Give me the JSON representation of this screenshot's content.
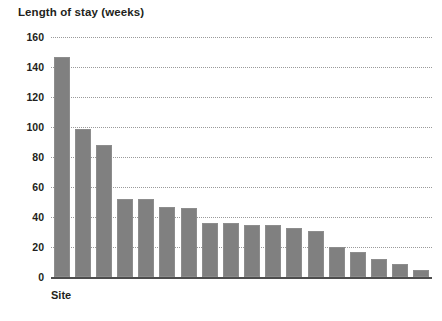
{
  "chart_data": {
    "type": "bar",
    "title": "Length of stay (weeks)",
    "xlabel": "Site",
    "ylabel": "Length of stay (weeks)",
    "ylim": [
      0,
      160
    ],
    "ytick_step": 20,
    "yticks": [
      0,
      20,
      40,
      60,
      80,
      100,
      120,
      140,
      160
    ],
    "grid": true,
    "legend": "none",
    "bar_color": "#808080",
    "categories": [
      "1",
      "2",
      "3",
      "4",
      "5",
      "6",
      "7",
      "8",
      "9",
      "10",
      "11",
      "12",
      "13",
      "14",
      "15",
      "16",
      "17",
      "18"
    ],
    "values": [
      147,
      99,
      88,
      52,
      52,
      47,
      46,
      36,
      36,
      35,
      35,
      33,
      31,
      20,
      17,
      12,
      9,
      5
    ]
  },
  "axis": {
    "ticks": [
      {
        "label": "160",
        "value": 160
      },
      {
        "label": "140",
        "value": 140
      },
      {
        "label": "120",
        "value": 120
      },
      {
        "label": "100",
        "value": 100
      },
      {
        "label": "80",
        "value": 80
      },
      {
        "label": "60",
        "value": 60
      },
      {
        "label": "40",
        "value": 40
      },
      {
        "label": "20",
        "value": 20
      },
      {
        "label": "0",
        "value": 0
      }
    ]
  }
}
